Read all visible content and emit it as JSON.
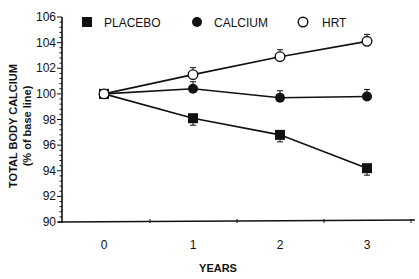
{
  "chart_data": {
    "type": "line",
    "title": "",
    "xlabel": "YEARS",
    "ylabel": "TOTAL BODY CALCIUM",
    "ylabel_sub": "(% of base line)",
    "x": [
      0,
      1,
      2,
      3
    ],
    "x_tick_labels": [
      "0",
      "1",
      "2",
      "3"
    ],
    "y_ticks": [
      90,
      92,
      94,
      96,
      98,
      100,
      102,
      104,
      106
    ],
    "y_tick_labels": [
      "90",
      "92",
      "94",
      "96",
      "98",
      "100",
      "102",
      "104",
      "106"
    ],
    "ylim": [
      90,
      106
    ],
    "grid": false,
    "legend_position": "top",
    "series": [
      {
        "name": "PLACEBO",
        "marker": "filled-square",
        "values": [
          100.0,
          98.1,
          96.8,
          94.2
        ],
        "error": [
          0,
          0.25,
          0.3,
          0.5
        ]
      },
      {
        "name": "CALCIUM",
        "marker": "filled-circle",
        "values": [
          100.0,
          100.4,
          99.7,
          99.8
        ],
        "error": [
          0,
          0.3,
          0.3,
          0.4
        ]
      },
      {
        "name": "HRT",
        "marker": "open-circle",
        "values": [
          100.0,
          101.5,
          102.9,
          104.1
        ],
        "error": [
          0,
          0.3,
          0.3,
          0.4
        ]
      }
    ]
  },
  "colors": {
    "ink": "#111111",
    "background": "#ffffff"
  }
}
